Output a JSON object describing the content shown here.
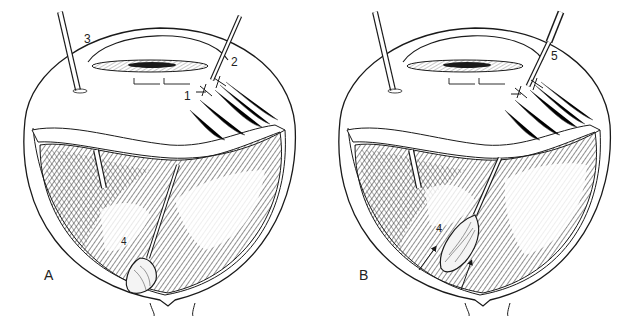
{
  "figure": {
    "panels": [
      {
        "id": "A",
        "letter": "A",
        "callouts": [
          {
            "num": "1",
            "target": "scleral-suture"
          },
          {
            "num": "2",
            "target": "instrument-port"
          },
          {
            "num": "3",
            "target": "light-pipe"
          },
          {
            "num": "4",
            "target": "foreign-body-in-forceps"
          }
        ]
      },
      {
        "id": "B",
        "letter": "B",
        "callouts": [
          {
            "num": "4",
            "target": "foreign-body-in-forceps"
          },
          {
            "num": "5",
            "target": "instrument-port"
          }
        ]
      }
    ],
    "colors": {
      "line": "#1a1a1a",
      "background": "#ffffff",
      "hatch": "#333333"
    }
  }
}
